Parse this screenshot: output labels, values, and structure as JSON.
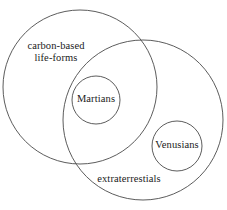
{
  "diagram": {
    "type": "euler-diagram",
    "background_color": "#ffffff",
    "stroke_color": "#4a4a4a",
    "text_color": "#1a1a1a",
    "labels": {
      "carbon_line1": "carbon-based",
      "carbon_line2": "life-forms",
      "martians": "Martians",
      "venusians": "Venusians",
      "extraterrestials": "extraterrestials"
    },
    "sets": [
      {
        "name": "carbon-based life-forms",
        "shape": "circle",
        "cx": 80,
        "cy": 87,
        "r": 77
      },
      {
        "name": "extraterrestials",
        "shape": "circle",
        "cx": 143,
        "cy": 120,
        "r": 80
      },
      {
        "name": "Martians",
        "shape": "circle",
        "cx": 96,
        "cy": 100,
        "r": 24
      },
      {
        "name": "Venusians",
        "shape": "circle",
        "cx": 177,
        "cy": 146,
        "r": 25
      }
    ]
  }
}
